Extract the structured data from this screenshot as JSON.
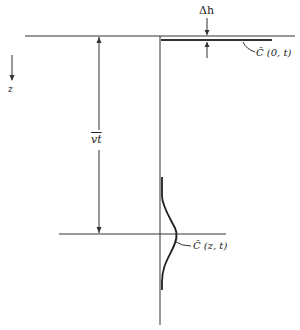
{
  "diagram": {
    "labels": {
      "delta_h": "Δh",
      "surface_concentration": "C̃ (0, t)",
      "advection_distance": "vt",
      "depth_axis": "z",
      "concentration_profile": "C̃ (z, t)"
    },
    "colors": {
      "line": "#333333",
      "background": "#ffffff"
    }
  }
}
